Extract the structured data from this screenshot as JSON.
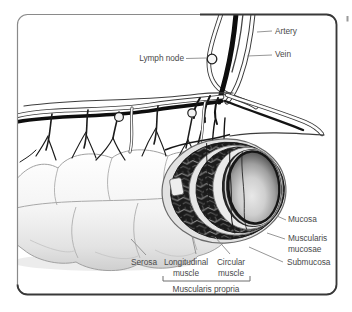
{
  "figure": {
    "labels": {
      "artery": "Artery",
      "vein": "Vein",
      "lymph_node": "Lymph node",
      "mucosa": "Mucosa",
      "muscularis_mucosae": [
        "Muscularis",
        "mucosae"
      ],
      "submucosa": "Submucosa",
      "serosa": "Serosa",
      "longitudinal_muscle": [
        "Longitudinal",
        "muscle"
      ],
      "circular_muscle": [
        "Circular",
        "muscle"
      ],
      "muscularis_propria": "Muscularis propria"
    },
    "colors": {
      "background": "#ffffff",
      "frame_border_light": "#8a8a8a",
      "frame_border_dark": "#383838",
      "label_text": "#4a4a4a",
      "leader_line": "#8b8b8b",
      "vein_vessel": "#0e0e0e",
      "artery_vessel_fill": "#fdfdfd",
      "artery_vessel_outline": "#3a3a3a",
      "muscle_layer_dark": "#1b1b1b",
      "tissue_light": "#f4f4f4",
      "mucosa_center": "#e6e6e6",
      "mucosa_rim": "#2b2b2b"
    }
  }
}
